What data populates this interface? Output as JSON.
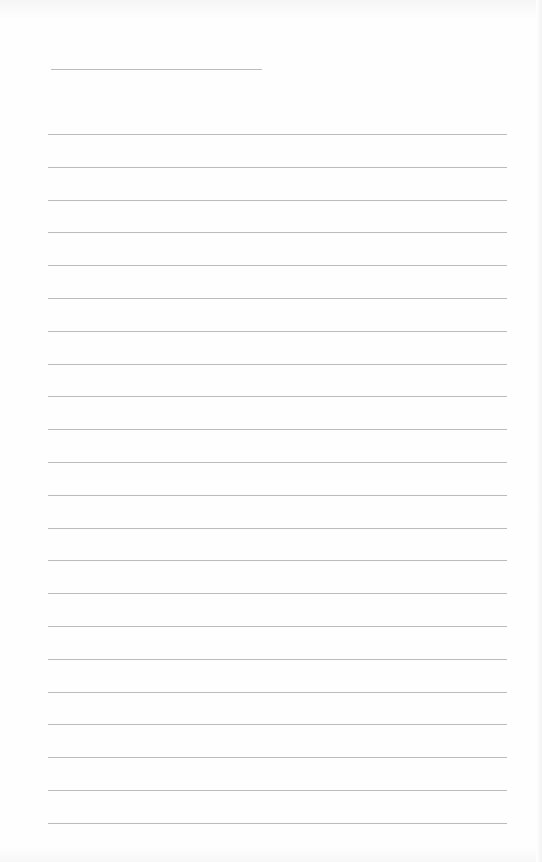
{
  "document": {
    "type": "lined-paper",
    "colors": {
      "paper": "#fefefe",
      "rule": "#bcbcbc"
    },
    "header_rule": {
      "x": 51,
      "y": 69,
      "width": 211
    },
    "body_rules": {
      "count": 22,
      "x": 48,
      "width": 459,
      "first_y": 134,
      "spacing": 32.8
    }
  }
}
